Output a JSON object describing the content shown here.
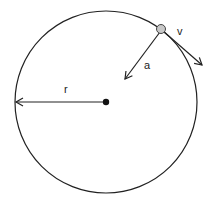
{
  "diagram": {
    "labels": {
      "radius": "r",
      "velocity": "v",
      "acceleration": "a"
    },
    "colors": {
      "stroke": "#222222",
      "particle_fill": "#c8c8c8",
      "center_fill": "#111111"
    }
  }
}
